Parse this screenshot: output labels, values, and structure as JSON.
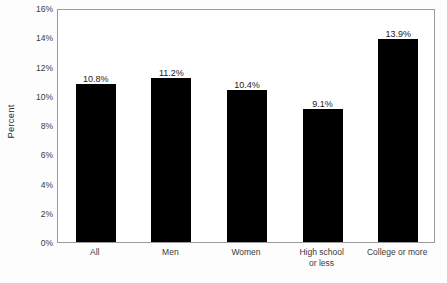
{
  "chart_data": {
    "type": "bar",
    "title": "",
    "xlabel": "",
    "ylabel": "Percent",
    "categories": [
      "All",
      "Men",
      "Women",
      "High school or less",
      "College or more"
    ],
    "category_lines": [
      [
        "All"
      ],
      [
        "Men"
      ],
      [
        "Women"
      ],
      [
        "High school",
        "or less"
      ],
      [
        "College or more"
      ]
    ],
    "values": [
      10.8,
      11.2,
      10.4,
      9.1,
      13.9
    ],
    "value_labels": [
      "10.8%",
      "11.2%",
      "10.4%",
      "9.1%",
      "13.9%"
    ],
    "ylim": [
      0,
      16
    ],
    "ytick_values": [
      0,
      2,
      4,
      6,
      8,
      10,
      12,
      14,
      16
    ],
    "ytick_labels": [
      "0%",
      "2%",
      "4%",
      "6%",
      "8%",
      "10%",
      "12%",
      "14%",
      "16%"
    ],
    "grid": false,
    "legend": null,
    "bar_color": "#000000",
    "frame_color": "#9a9a9a",
    "background_color": "#ffffff",
    "text_color": "#3a3a3a"
  }
}
